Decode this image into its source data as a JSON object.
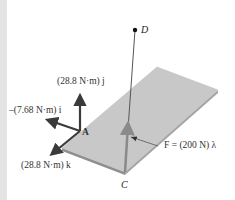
{
  "figure": {
    "background": "#ffffff",
    "plate": {
      "top_color": "#c9c9c9",
      "edge_color": "#9a9a9a"
    },
    "points": {
      "A": "A",
      "C": "C",
      "D": "D"
    },
    "labels": {
      "moment_j": "(28.8 N·m) j",
      "moment_i": "–(7.68 N·m) i",
      "moment_k": "(28.8 N·m) k",
      "force": "F = (200 N) λ"
    },
    "colors": {
      "couple_arrows": "#3a3a3a",
      "force_arrow": "#888888",
      "rod": "#555555"
    }
  }
}
